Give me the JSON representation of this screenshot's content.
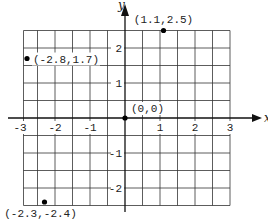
{
  "chart_data": {
    "type": "scatter",
    "title": "",
    "xlabel": "x",
    "ylabel": "y",
    "xlim": [
      -2.9,
      3.0
    ],
    "ylim": [
      -2.5,
      2.5
    ],
    "grid": true,
    "grid_step": 0.5,
    "x_ticks": [
      "-3",
      "-2",
      "-1",
      "1",
      "2",
      "3"
    ],
    "y_ticks": [
      "2",
      "1",
      "-1",
      "-2"
    ],
    "points": [
      {
        "x": -2.8,
        "y": 1.7,
        "label": "(-2.8,1.7)"
      },
      {
        "x": 1.1,
        "y": 2.5,
        "label": "(1.1,2.5)"
      },
      {
        "x": 0,
        "y": 0,
        "label": "(0,0)"
      },
      {
        "x": -2.3,
        "y": -2.4,
        "label": "(-2.3,-2.4)"
      }
    ]
  },
  "axes": {
    "x_label": "x",
    "y_label": "y"
  },
  "ticks": {
    "x": [
      {
        "v": -3,
        "t": "-3"
      },
      {
        "v": -2,
        "t": "-2"
      },
      {
        "v": -1,
        "t": "-1"
      },
      {
        "v": 1,
        "t": "1"
      },
      {
        "v": 2,
        "t": "2"
      },
      {
        "v": 3,
        "t": "3"
      }
    ],
    "y": [
      {
        "v": 2,
        "t": "2"
      },
      {
        "v": 1,
        "t": "1"
      },
      {
        "v": -1,
        "t": "-1"
      },
      {
        "v": -2,
        "t": "-2"
      }
    ]
  },
  "colors": {
    "grid": "#333333",
    "point": "#000000",
    "text": "#222222"
  }
}
